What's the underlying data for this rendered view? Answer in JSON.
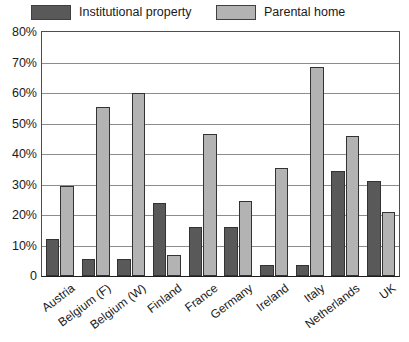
{
  "legend": {
    "entries": [
      {
        "label": "Institutional property",
        "key": "institutional",
        "color": "#595959"
      },
      {
        "label": "Parental home",
        "key": "parental",
        "color": "#b3b3b3"
      }
    ]
  },
  "axes": {
    "y_tick_labels": [
      "80%",
      "70%",
      "60%",
      "50%",
      "40%",
      "30%",
      "20%",
      "10%",
      "0"
    ]
  },
  "chart_data": {
    "type": "bar",
    "title": "",
    "subtitle": "",
    "xlabel": "",
    "ylabel": "",
    "ylim": [
      0,
      80
    ],
    "ytick_values": [
      0,
      10,
      20,
      30,
      40,
      50,
      60,
      70,
      80
    ],
    "ytick_labels": [
      "0",
      "10%",
      "20%",
      "30%",
      "40%",
      "50%",
      "60%",
      "70%",
      "80%"
    ],
    "grid": true,
    "legend_position": "top",
    "categories": [
      "Austria",
      "Belgium (F)",
      "Belgium (W)",
      "Finland",
      "France",
      "Germany",
      "Ireland",
      "Italy",
      "Netherlands",
      "UK"
    ],
    "series": [
      {
        "name": "Institutional property",
        "color": "#595959",
        "values": [
          12,
          5.5,
          5.5,
          24,
          16,
          16,
          3.5,
          3.5,
          34.5,
          31
        ]
      },
      {
        "name": "Parental home",
        "color": "#b3b3b3",
        "values": [
          29.5,
          55.5,
          60,
          7,
          46.5,
          24.5,
          35.5,
          68.5,
          46,
          21
        ]
      }
    ]
  }
}
